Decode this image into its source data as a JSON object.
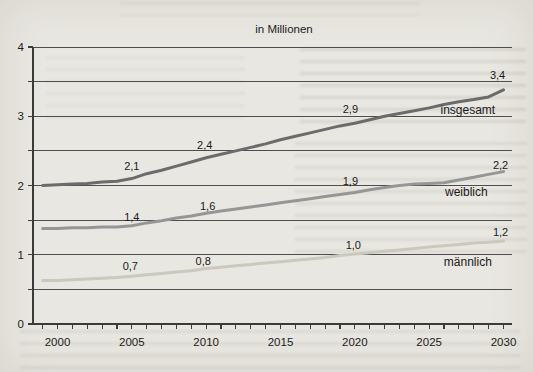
{
  "title": "in Millionen",
  "colors": {
    "background": "#e9e7e1",
    "grid": "#4e4e4e",
    "axis": "#3c3c3c",
    "text": "#1c1c1c"
  },
  "chart_data": {
    "type": "line",
    "title": "in Millionen",
    "xlabel": "",
    "ylabel": "",
    "xlim": [
      1998.3,
      2030.6
    ],
    "ylim": [
      0,
      4
    ],
    "grid_interval": 0.5,
    "grid": true,
    "legend_position": "inline-labels",
    "xticks_labeled": [
      2000,
      2005,
      2010,
      2015,
      2020,
      2025,
      2030
    ],
    "yticks_labeled": [
      0,
      1,
      2,
      3,
      4
    ],
    "x": [
      1999,
      2000,
      2001,
      2002,
      2003,
      2004,
      2005,
      2006,
      2007,
      2008,
      2009,
      2010,
      2011,
      2012,
      2013,
      2014,
      2015,
      2016,
      2017,
      2018,
      2019,
      2020,
      2021,
      2022,
      2023,
      2024,
      2025,
      2026,
      2027,
      2028,
      2029,
      2030
    ],
    "series": [
      {
        "name": "insgesamt",
        "color": "#6b6b6b",
        "values": [
          2.0,
          2.01,
          2.02,
          2.03,
          2.05,
          2.06,
          2.1,
          2.17,
          2.22,
          2.28,
          2.34,
          2.4,
          2.45,
          2.5,
          2.55,
          2.6,
          2.66,
          2.71,
          2.76,
          2.81,
          2.86,
          2.9,
          2.95,
          3.0,
          3.04,
          3.08,
          3.12,
          3.17,
          3.21,
          3.24,
          3.28,
          3.38
        ],
        "labeled_points": [
          {
            "x": 2005,
            "y": 2.1,
            "label": "2,1"
          },
          {
            "x": 2010,
            "y": 2.4,
            "label": "2,4"
          },
          {
            "x": 2020,
            "y": 2.9,
            "label": "2,9"
          },
          {
            "x": 2030,
            "y": 3.4,
            "label": "3,4"
          }
        ]
      },
      {
        "name": "weiblich",
        "color": "#969696",
        "values": [
          1.38,
          1.38,
          1.39,
          1.39,
          1.4,
          1.4,
          1.42,
          1.46,
          1.49,
          1.53,
          1.56,
          1.6,
          1.63,
          1.66,
          1.69,
          1.72,
          1.75,
          1.78,
          1.81,
          1.84,
          1.87,
          1.9,
          1.94,
          1.97,
          2.0,
          2.02,
          2.03,
          2.04,
          2.08,
          2.12,
          2.16,
          2.2
        ],
        "labeled_points": [
          {
            "x": 2005,
            "y": 1.4,
            "label": "1,4"
          },
          {
            "x": 2010,
            "y": 1.6,
            "label": "1,6"
          },
          {
            "x": 2020,
            "y": 1.9,
            "label": "1,9"
          },
          {
            "x": 2030,
            "y": 2.2,
            "label": "2,2"
          }
        ]
      },
      {
        "name": "männlich",
        "color": "#ccc8bc",
        "values": [
          0.63,
          0.63,
          0.64,
          0.65,
          0.66,
          0.67,
          0.69,
          0.71,
          0.73,
          0.75,
          0.77,
          0.8,
          0.82,
          0.84,
          0.86,
          0.88,
          0.9,
          0.92,
          0.94,
          0.96,
          0.99,
          1.01,
          1.03,
          1.05,
          1.07,
          1.09,
          1.11,
          1.13,
          1.15,
          1.17,
          1.18,
          1.2
        ],
        "labeled_points": [
          {
            "x": 2005,
            "y": 0.7,
            "label": "0,7"
          },
          {
            "x": 2010,
            "y": 0.8,
            "label": "0,8"
          },
          {
            "x": 2020,
            "y": 1.0,
            "label": "1,0"
          },
          {
            "x": 2030,
            "y": 1.2,
            "label": "1,2"
          }
        ]
      }
    ],
    "annotations": [
      {
        "text": "2,1",
        "year": 2005.0,
        "value": 2.28,
        "kind": "value"
      },
      {
        "text": "2,4",
        "year": 2009.9,
        "value": 2.59,
        "kind": "value"
      },
      {
        "text": "2,9",
        "year": 2019.7,
        "value": 3.1,
        "kind": "value"
      },
      {
        "text": "3,4",
        "year": 2029.6,
        "value": 3.6,
        "kind": "value"
      },
      {
        "text": "insgesamt",
        "year": 2027.6,
        "value": 3.09,
        "kind": "series"
      },
      {
        "text": "1,4",
        "year": 2005.0,
        "value": 1.55,
        "kind": "value"
      },
      {
        "text": "1,6",
        "year": 2010.1,
        "value": 1.7,
        "kind": "value"
      },
      {
        "text": "1,9",
        "year": 2019.7,
        "value": 2.06,
        "kind": "value"
      },
      {
        "text": "2,2",
        "year": 2029.8,
        "value": 2.29,
        "kind": "value"
      },
      {
        "text": "weiblich",
        "year": 2027.5,
        "value": 1.9,
        "kind": "series"
      },
      {
        "text": "0,7",
        "year": 2004.9,
        "value": 0.84,
        "kind": "value"
      },
      {
        "text": "0,8",
        "year": 2009.8,
        "value": 0.91,
        "kind": "value"
      },
      {
        "text": "1,0",
        "year": 2019.9,
        "value": 1.14,
        "kind": "value"
      },
      {
        "text": "1,2",
        "year": 2029.8,
        "value": 1.33,
        "kind": "value"
      },
      {
        "text": "männlich",
        "year": 2027.6,
        "value": 0.9,
        "kind": "series"
      }
    ]
  }
}
